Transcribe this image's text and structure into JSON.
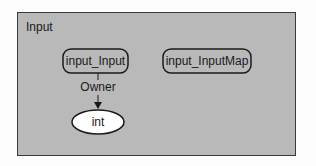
{
  "diagram": {
    "frame_title": "Input",
    "nodes": [
      {
        "id": "input_Input",
        "label": "input_Input",
        "shape": "rounded-rect"
      },
      {
        "id": "input_InputMap",
        "label": "input_InputMap",
        "shape": "rounded-rect"
      },
      {
        "id": "int",
        "label": "int",
        "shape": "ellipse"
      }
    ],
    "edges": [
      {
        "from": "input_Input",
        "to": "int",
        "label": "Owner"
      }
    ],
    "colors": {
      "frame_background": "#b9b9b9",
      "node_fill": "#b9b9b9",
      "ellipse_fill": "#ffffff",
      "stroke": "#1a1a1a"
    }
  }
}
